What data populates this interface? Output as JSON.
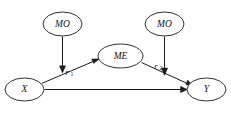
{
  "diagram": {
    "type": "path-diagram",
    "nodes": [
      {
        "id": "mo_left",
        "label": "MO",
        "shape": "ellipse",
        "cx": 62.5,
        "cy": 24,
        "rx": 19.5,
        "ry": 12
      },
      {
        "id": "mo_right",
        "label": "MO",
        "shape": "ellipse",
        "cx": 164.5,
        "cy": 24,
        "rx": 19.5,
        "ry": 12
      },
      {
        "id": "me",
        "label": "ME",
        "shape": "ellipse",
        "cx": 120.5,
        "cy": 56,
        "rx": 22.5,
        "ry": 12
      },
      {
        "id": "x",
        "label": "X",
        "shape": "ellipse",
        "cx": 24.5,
        "cy": 89.5,
        "rx": 19.5,
        "ry": 11.5
      },
      {
        "id": "y",
        "label": "Y",
        "shape": "ellipse",
        "cx": 206.5,
        "cy": 89.5,
        "rx": 19.5,
        "ry": 11.5
      }
    ],
    "edges": [
      {
        "id": "x_to_me",
        "from": "x",
        "to": "me",
        "label": "",
        "sub": "",
        "style": "solid",
        "arrow": "end"
      },
      {
        "id": "me_to_y",
        "from": "me",
        "to": "y",
        "label": "",
        "sub": "",
        "style": "solid",
        "arrow": "end"
      },
      {
        "id": "x_to_y",
        "from": "x",
        "to": "y",
        "label": "",
        "sub": "",
        "style": "solid",
        "arrow": "end"
      },
      {
        "id": "mo_left_mod",
        "from": "mo_left",
        "to": "x_to_me",
        "label": "r",
        "sub": "1",
        "style": "solid",
        "arrow": "end"
      },
      {
        "id": "mo_right_mod",
        "from": "mo_right",
        "to": "me_to_y",
        "label": "r",
        "sub": "2",
        "style": "solid",
        "arrow": "end"
      }
    ],
    "edge_labels": [
      {
        "id": "r1",
        "base": "r",
        "sub": "1",
        "x": 68.5,
        "y": 73
      },
      {
        "id": "r2",
        "base": "r",
        "sub": "2",
        "x": 157.5,
        "y": 67
      }
    ]
  }
}
